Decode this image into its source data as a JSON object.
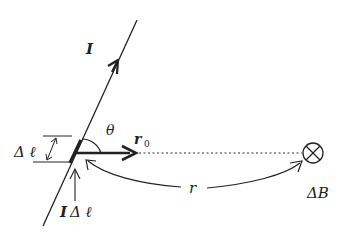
{
  "diagram": {
    "labels": {
      "current": "I",
      "theta": "θ",
      "r0_main": "r",
      "r0_sub": "0",
      "delta_l": "Δ ℓ",
      "i_delta_l_bold": "I",
      "i_delta_l_rest": "Δ ℓ",
      "r": "r",
      "delta_b": "ΔB"
    },
    "colors": {
      "stroke": "#222222",
      "background": "#ffffff"
    },
    "symbols": {
      "field_into_page": "⊗"
    }
  }
}
